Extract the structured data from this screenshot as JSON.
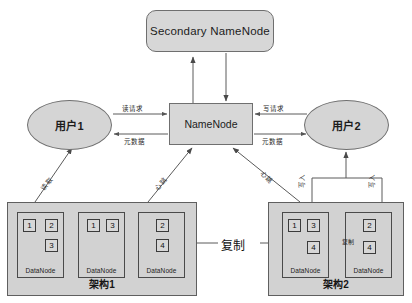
{
  "diagram": {
    "colors": {
      "fill": "#d5d5d5",
      "stroke": "#6f6f6f",
      "rack_fill": "#d2d2d2",
      "text": "#1c1c1c",
      "background": "#ffffff"
    }
  },
  "nodes": {
    "secondary_namenode": {
      "label": "Secondary  NameNode"
    },
    "namenode": {
      "label": "NameNode"
    },
    "user1": {
      "label": "用户1"
    },
    "user2": {
      "label": "用户2"
    }
  },
  "racks": [
    {
      "label": "架构1",
      "datanodes": [
        {
          "label": "DataNode",
          "blocks": [
            "1",
            "2",
            "3"
          ]
        },
        {
          "label": "DataNode",
          "blocks": [
            "1",
            "3"
          ]
        },
        {
          "label": "DataNode",
          "blocks": [
            "2",
            "4"
          ]
        }
      ]
    },
    {
      "label": "架构2",
      "datanodes": [
        {
          "label": "DataNode",
          "blocks": [
            "1",
            "3",
            "4"
          ]
        },
        {
          "label": "DataNode",
          "blocks": [
            "2",
            "4"
          ]
        }
      ]
    }
  ],
  "edge_labels": {
    "read_request": "读请求",
    "write_request": "写请求",
    "metadata_left": "元数据",
    "metadata_right": "元数据",
    "read": "读取",
    "heartbeat_left": "心跳",
    "heartbeat_right": "心跳",
    "write_in_left": "写入",
    "write_in_right": "写入",
    "replicate_center": "复制",
    "replicate_rack2": "复制"
  }
}
